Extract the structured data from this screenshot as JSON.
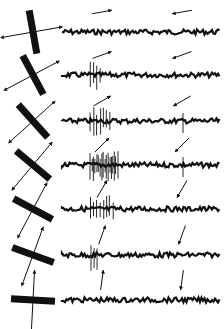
{
  "figure": {
    "ink_color": "#111111",
    "background": "#ffffff",
    "rows": [
      {
        "bar_angle_deg": 80,
        "trace_y": 32,
        "fwd_arrow_angle": -10,
        "back_arrow_angle": 170,
        "fwd_spikes": 0,
        "back_spikes": 0
      },
      {
        "bar_angle_deg": 62,
        "trace_y": 75,
        "fwd_arrow_angle": -20,
        "back_arrow_angle": 160,
        "fwd_spikes": 4,
        "back_spikes": 0
      },
      {
        "bar_angle_deg": 48,
        "trace_y": 121,
        "fwd_arrow_angle": -30,
        "back_arrow_angle": 150,
        "fwd_spikes": 7,
        "back_spikes": 1
      },
      {
        "bar_angle_deg": 40,
        "trace_y": 165,
        "fwd_arrow_angle": -45,
        "back_arrow_angle": 135,
        "fwd_spikes": 18,
        "back_spikes": 1
      },
      {
        "bar_angle_deg": 28,
        "trace_y": 209,
        "fwd_arrow_angle": -60,
        "back_arrow_angle": 120,
        "fwd_spikes": 8,
        "back_spikes": 0
      },
      {
        "bar_angle_deg": 20,
        "trace_y": 255,
        "fwd_arrow_angle": -70,
        "back_arrow_angle": 110,
        "fwd_spikes": 3,
        "back_spikes": 0
      },
      {
        "bar_angle_deg": 3,
        "trace_y": 300,
        "fwd_arrow_angle": -82,
        "back_arrow_angle": 98,
        "fwd_spikes": 0,
        "back_spikes": 0
      }
    ]
  }
}
